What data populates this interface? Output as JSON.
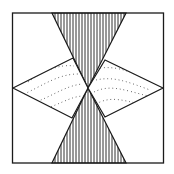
{
  "diagram": {
    "type": "quilt-block",
    "colors": {
      "line": "#1a1a1a",
      "background": "#ffffff"
    },
    "shapes": [
      {
        "name": "top-hatched-triangle",
        "fill": "vertical-hatch"
      },
      {
        "name": "bottom-hatched-triangle",
        "fill": "vertical-hatch"
      },
      {
        "name": "left-dotted-kite",
        "fill": "dotted-waves"
      },
      {
        "name": "right-dotted-kite",
        "fill": "dotted-waves"
      }
    ]
  }
}
